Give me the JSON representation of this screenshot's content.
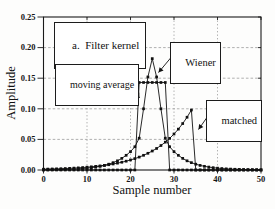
{
  "figure": {
    "panel_label": "a.  Filter kernel",
    "annotations": {
      "moving_average": "moving average",
      "wiener": "Wiener",
      "matched": "matched"
    }
  },
  "chart_data": {
    "type": "line",
    "title": "a. Filter kernel",
    "xlabel": "Sample number",
    "ylabel": "Amplitude",
    "xlim": [
      0,
      50
    ],
    "ylim": [
      0,
      0.25
    ],
    "x_ticks": [
      0,
      10,
      20,
      30,
      40,
      50
    ],
    "y_ticks": [
      0,
      0.05,
      0.1,
      0.15,
      0.2,
      0.25
    ],
    "grid": "dashed",
    "legend_position": "none (curves labeled by boxed annotations with arrows)",
    "marker": "filled-square",
    "x": [
      0,
      1,
      2,
      3,
      4,
      5,
      6,
      7,
      8,
      9,
      10,
      11,
      12,
      13,
      14,
      15,
      16,
      17,
      18,
      19,
      20,
      21,
      22,
      23,
      24,
      25,
      26,
      27,
      28,
      29,
      30,
      31,
      32,
      33,
      34,
      35,
      36,
      37,
      38,
      39,
      40,
      41,
      42,
      43,
      44,
      45,
      46,
      47,
      48,
      49,
      50
    ],
    "series": [
      {
        "name": "moving average",
        "values": [
          0,
          0,
          0,
          0,
          0,
          0,
          0,
          0,
          0,
          0,
          0,
          0,
          0,
          0,
          0,
          0,
          0,
          0,
          0,
          0,
          0,
          0,
          0.143,
          0.143,
          0.143,
          0.143,
          0.143,
          0.143,
          0.143,
          0,
          0,
          0,
          0,
          0,
          0,
          0,
          0,
          0,
          0,
          0,
          0,
          0,
          0,
          0,
          0,
          0,
          0,
          0,
          0,
          0,
          0
        ]
      },
      {
        "name": "Wiener",
        "values": [
          0.0003,
          0.0004,
          0.0005,
          0.0006,
          0.0008,
          0.001,
          0.0012,
          0.0015,
          0.0019,
          0.0024,
          0.003,
          0.0038,
          0.0048,
          0.006,
          0.0075,
          0.0095,
          0.012,
          0.015,
          0.019,
          0.024,
          0.03,
          0.038,
          0.052,
          0.1,
          0.152,
          0.182,
          0.152,
          0.1,
          0.052,
          0.038,
          0.03,
          0.024,
          0.019,
          0.015,
          0.012,
          0.0095,
          0.0075,
          0.006,
          0.0048,
          0.0038,
          0.003,
          0.0024,
          0.0019,
          0.0015,
          0.0012,
          0.001,
          0.0008,
          0.0006,
          0.0005,
          0.0004,
          0.0003
        ]
      },
      {
        "name": "matched",
        "values": [
          0.0013,
          0.0015,
          0.0017,
          0.0019,
          0.0021,
          0.0024,
          0.0027,
          0.0031,
          0.0035,
          0.004,
          0.0046,
          0.0052,
          0.0059,
          0.0067,
          0.0076,
          0.0086,
          0.0098,
          0.0112,
          0.0127,
          0.0144,
          0.0164,
          0.0186,
          0.0211,
          0.024,
          0.0273,
          0.031,
          0.0352,
          0.04,
          0.0455,
          0.0517,
          0.0588,
          0.0668,
          0.0759,
          0.0862,
          0.098,
          0,
          0,
          0,
          0,
          0,
          0,
          0,
          0,
          0,
          0,
          0,
          0,
          0,
          0,
          0,
          0
        ]
      }
    ]
  }
}
